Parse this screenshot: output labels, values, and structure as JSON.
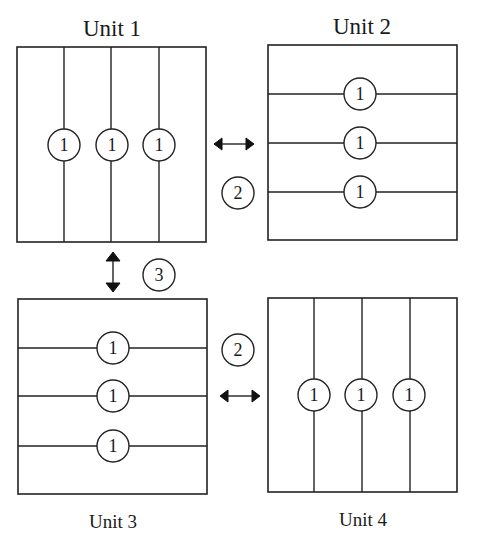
{
  "diagram": {
    "units": [
      {
        "label": "Unit 1",
        "orientation": "vertical",
        "partition_count": 4,
        "marker": "1"
      },
      {
        "label": "Unit 2",
        "orientation": "horizontal",
        "partition_count": 4,
        "marker": "1"
      },
      {
        "label": "Unit 3",
        "orientation": "horizontal",
        "partition_count": 4,
        "marker": "1"
      },
      {
        "label": "Unit 4",
        "orientation": "vertical",
        "partition_count": 4,
        "marker": "1"
      }
    ],
    "connections": [
      {
        "from": "Unit 1",
        "to": "Unit 2",
        "arrow": "horizontal-double",
        "marker": "2"
      },
      {
        "from": "Unit 1",
        "to": "Unit 3",
        "arrow": "vertical-double",
        "marker": "3"
      },
      {
        "from": "Unit 3",
        "to": "Unit 4",
        "arrow": "horizontal-double",
        "marker": "2"
      }
    ],
    "markers": {
      "one": "1",
      "two": "2",
      "three": "3"
    }
  }
}
